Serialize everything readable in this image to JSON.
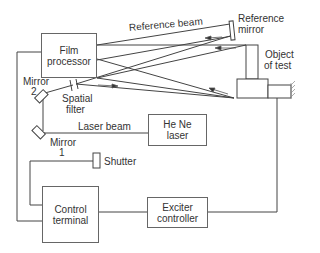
{
  "diagram": {
    "type": "holographic interferometry setup schematic",
    "components": {
      "film_processor": {
        "line1": "Film",
        "line2": "processor"
      },
      "control_terminal": {
        "line1": "Control",
        "line2": "terminal"
      },
      "exciter_controller": {
        "line1": "Exciter",
        "line2": "controller"
      },
      "he_ne_laser": {
        "line1": "He Ne",
        "line2": "laser"
      }
    },
    "labels": {
      "reference_beam": "Reference beam",
      "reference_mirror_1": "Reference",
      "reference_mirror_2": "mirror",
      "object_of_test_1": "Object",
      "object_of_test_2": "of test",
      "mirror2_1": "Mirror",
      "mirror2_2": "2",
      "spatial_filter_1": "Spatial",
      "spatial_filter_2": "filter",
      "laser_beam": "Laser beam",
      "mirror1_1": "Mirror",
      "mirror1_2": "1",
      "shutter": "Shutter"
    },
    "connections": [
      {
        "from": "Film processor",
        "to": "Control terminal"
      },
      {
        "from": "Shutter",
        "to": "Control terminal"
      },
      {
        "from": "Control terminal",
        "to": "Exciter controller"
      },
      {
        "from": "Exciter controller",
        "to": "Object of test"
      },
      {
        "from": "He Ne laser",
        "to": "Mirror 1",
        "label": "Laser beam"
      },
      {
        "from": "Mirror 1",
        "to": "Mirror 2"
      },
      {
        "from": "Mirror 2",
        "to": "Spatial filter"
      },
      {
        "from": "Spatial filter",
        "to": "Reference mirror"
      },
      {
        "from": "Spatial filter",
        "to": "Object of test"
      },
      {
        "from": "Reference mirror",
        "to": "Film processor",
        "label": "Reference beam"
      },
      {
        "from": "Object of test",
        "to": "Film processor"
      }
    ]
  }
}
